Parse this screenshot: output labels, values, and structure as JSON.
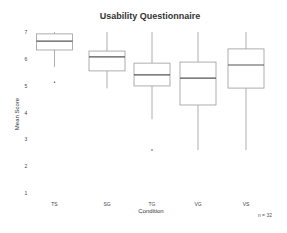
{
  "chart_data": {
    "type": "boxplot",
    "title": "Usability Questionnaire",
    "xlabel": "Condition",
    "ylabel": "Mean Score",
    "ylim": [
      1,
      7
    ],
    "yticks": [
      1,
      2,
      3,
      4,
      5,
      6,
      7
    ],
    "grid": false,
    "annotation": "n = 32",
    "categories": [
      "TS",
      "SG",
      "TG",
      "VG",
      "VS"
    ],
    "boxes": [
      {
        "label": "TS",
        "whisker_high": 7.0,
        "q3": 6.93,
        "median": 6.66,
        "q1": 6.33,
        "whisker_low": 5.7,
        "outliers": [
          5.13
        ]
      },
      {
        "label": "SG",
        "whisker_high": 7.0,
        "q3": 6.29,
        "median": 6.07,
        "q1": 5.55,
        "whisker_low": 4.9,
        "outliers": []
      },
      {
        "label": "TG",
        "whisker_high": 7.0,
        "q3": 5.84,
        "median": 5.4,
        "q1": 4.99,
        "whisker_low": 3.75,
        "outliers": [
          2.6
        ]
      },
      {
        "label": "VG",
        "whisker_high": 7.0,
        "q3": 5.88,
        "median": 5.28,
        "q1": 4.28,
        "whisker_low": 2.6,
        "outliers": []
      },
      {
        "label": "VS",
        "whisker_high": 7.0,
        "q3": 6.37,
        "median": 5.77,
        "q1": 4.91,
        "whisker_low": 2.6,
        "outliers": []
      }
    ]
  },
  "colors": {
    "box_stroke": "#9a9a9a",
    "median": "#555555",
    "text": "#333333"
  }
}
